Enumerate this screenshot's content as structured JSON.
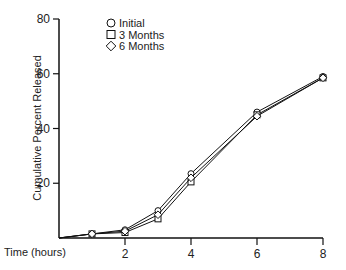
{
  "chart_data": {
    "type": "line",
    "title": "",
    "xlabel": "Time (hours)",
    "ylabel": "Cumulative Percent Released",
    "xlim": [
      0,
      8
    ],
    "ylim": [
      0,
      80
    ],
    "x_ticks": [
      2,
      4,
      6,
      8
    ],
    "y_ticks": [
      20,
      40,
      60,
      80
    ],
    "grid": false,
    "legend_position": "top-left inside",
    "x": [
      0,
      1,
      2,
      3,
      4,
      6,
      8
    ],
    "series": [
      {
        "name": "Initial",
        "marker": "circle",
        "values": [
          0,
          1.5,
          3,
          10,
          23.5,
          46,
          59
        ]
      },
      {
        "name": "3 Months",
        "marker": "square",
        "values": [
          0,
          1.5,
          2,
          7,
          20.5,
          45,
          58.5
        ]
      },
      {
        "name": "6 Months",
        "marker": "diamond",
        "values": [
          0,
          1.5,
          2.5,
          8.5,
          22,
          44.5,
          58.5
        ]
      }
    ]
  },
  "labels": {
    "xlabel": "Time (hours)",
    "ylabel": "Cumulative Percent Released",
    "legend": [
      "Initial",
      "3 Months",
      "6 Months"
    ]
  }
}
